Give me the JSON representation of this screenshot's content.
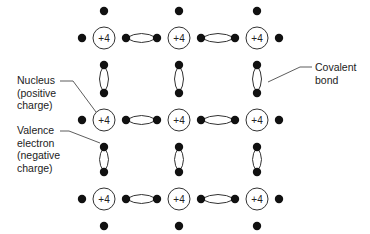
{
  "diagram": {
    "title": "",
    "nucleus_charge_label": "+4",
    "grid": {
      "columns_x": [
        104,
        179,
        257
      ],
      "rows_y": [
        38,
        120,
        199
      ],
      "nucleus_radius": 11,
      "electron_radius": 4.2,
      "electron_offset_h": 22,
      "electron_offset_v": 27
    },
    "colors": {
      "line": "#333333",
      "electron": "#111111",
      "text": "#222222",
      "background": "#ffffff"
    },
    "labels": {
      "nucleus": {
        "lines": [
          "Nucleus",
          "(positive",
          "charge)"
        ],
        "text": "Nucleus\n(positive\ncharge)"
      },
      "valence": {
        "lines": [
          "Valence",
          "electron",
          "(negative",
          "charge)"
        ],
        "text": "Valence\nelectron\n(negative\ncharge)"
      },
      "covalent": {
        "lines": [
          "Covalent",
          "bond"
        ],
        "text": "Covalent\nbond"
      }
    }
  }
}
